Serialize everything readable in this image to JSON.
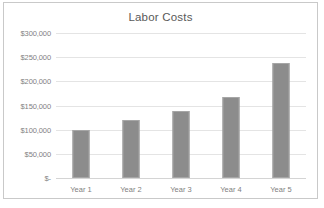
{
  "chart_data": {
    "type": "bar",
    "title": "Labor Costs",
    "xlabel": "",
    "ylabel": "",
    "categories": [
      "Year 1",
      "Year 2",
      "Year 3",
      "Year 4",
      "Year 5"
    ],
    "values": [
      100000,
      120000,
      138000,
      168000,
      238000
    ],
    "ylim": [
      0,
      300000
    ],
    "ytick_values": [
      300000,
      250000,
      200000,
      150000,
      100000,
      50000,
      0
    ],
    "ytick_labels": [
      "$300,000",
      "$250,000",
      "$200,000",
      "$150,000",
      "$100,000",
      "$50,000",
      "$-"
    ],
    "grid": true,
    "legend": false,
    "bar_color": "#8c8c8c",
    "bar_border_color": "#a6a6a6",
    "gridline_color": "#e4e4e4",
    "axis_text_color": "#7f7f7f",
    "title_color": "#595959",
    "frame_border_color": "#c9c9c9",
    "background_color": "#ffffff"
  }
}
